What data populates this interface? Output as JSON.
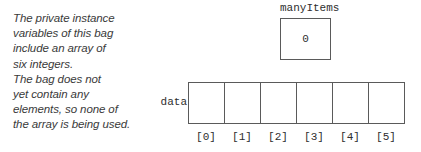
{
  "annotation": {
    "lines": [
      "The private instance",
      "variables of this bag",
      "include an array of",
      "six integers.",
      "The bag does not",
      "yet contain any",
      "elements, so none of",
      "the array is being used."
    ]
  },
  "many_items": {
    "label": "manyItems",
    "value": "0"
  },
  "array": {
    "label": "data",
    "cells": [
      "",
      "",
      "",
      "",
      "",
      ""
    ],
    "indices": [
      "[0]",
      "[1]",
      "[2]",
      "[3]",
      "[4]",
      "[5]"
    ]
  },
  "colors": {
    "background": "#ffffff",
    "border": "#5a5a5a",
    "text": "#2e2e2e",
    "annotation_text": "#3a3a3a"
  }
}
